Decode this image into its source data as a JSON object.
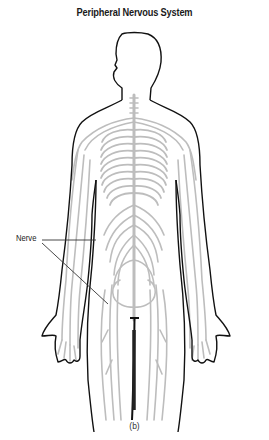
{
  "title": "Peripheral Nervous System",
  "labels": [
    {
      "text": "Nerve",
      "pointers": 2
    }
  ],
  "caption": "(b)",
  "colors": {
    "outline": "#111111",
    "nerves": "#bdbdbd",
    "text": "#1a1a1a",
    "background": "#ffffff"
  }
}
